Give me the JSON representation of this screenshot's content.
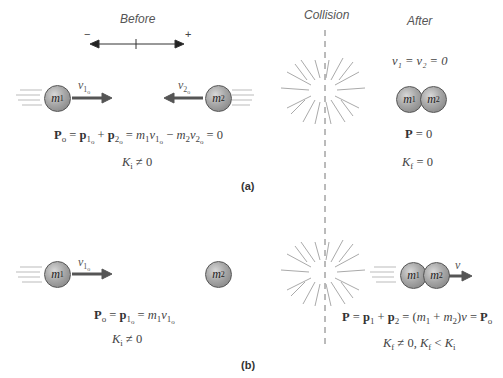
{
  "panel_a": {
    "label": "(a)",
    "before_label": "Before",
    "collision_label": "Collision",
    "after_label": "After",
    "axis": {
      "minus": "−",
      "plus": "+"
    },
    "ball1": {
      "mass": "m",
      "sub": "1"
    },
    "ball2": {
      "mass": "m",
      "sub": "2"
    },
    "v1o": {
      "v": "v",
      "sub": "1",
      "subsub": "o"
    },
    "v2o": {
      "v": "v",
      "sub": "2",
      "subsub": "o"
    },
    "momentum_eq": {
      "P": "P",
      "o": "o",
      "eq1": " = ",
      "p1": "p",
      "p1sub": "1",
      "p1subsub": "o",
      "plus": " + ",
      "p2": "p",
      "p2sub": "2",
      "p2subsub": "o",
      "eq2": " = ",
      "m1": "m",
      "m1sub": "1",
      "v1": "v",
      "v1sub": "1",
      "v1subsub": "o",
      "minus": " − ",
      "m2": "m",
      "m2sub": "2",
      "v2": "v",
      "v2sub": "2",
      "v2subsub": "o",
      "tail": " = 0"
    },
    "ki": {
      "K": "K",
      "sub": "i",
      "rest": " ≠ 0"
    },
    "after_velocity": "v₁ = v₂ = 0",
    "after_ball1": {
      "mass": "m",
      "sub": "1"
    },
    "after_ball2": {
      "mass": "m",
      "sub": "2"
    },
    "after_P": {
      "P": "P",
      "rest": " = 0"
    },
    "kf": {
      "K": "K",
      "sub": "f",
      "rest": " = 0"
    }
  },
  "panel_b": {
    "label": "(b)",
    "ball1": {
      "mass": "m",
      "sub": "1"
    },
    "ball2": {
      "mass": "m",
      "sub": "2"
    },
    "v1o": {
      "v": "v",
      "sub": "1",
      "subsub": "o"
    },
    "momentum_eq": {
      "P": "P",
      "o": "o",
      "eq1": " = ",
      "p1": "p",
      "p1sub": "1",
      "p1subsub": "o",
      "eq2": " = ",
      "m1": "m",
      "m1sub": "1",
      "v1": "v",
      "v1sub": "1",
      "v1subsub": "o"
    },
    "ki": {
      "K": "K",
      "sub": "i",
      "rest": " ≠ 0"
    },
    "after_ball1": {
      "mass": "m",
      "sub": "1"
    },
    "after_ball2": {
      "mass": "m",
      "sub": "2"
    },
    "after_v": "v",
    "after_eq": {
      "P": "P",
      "eq1": " = ",
      "p1": "p",
      "p1sub": "1",
      "plus": " + ",
      "p2": "p",
      "p2sub": "2",
      "eq2": " = (",
      "m1": "m",
      "m1sub": "1",
      "plus2": " + ",
      "m2": "m",
      "m2sub": "2",
      "close": ")",
      "v": "v",
      "eq3": " = ",
      "Po": "P",
      "Posub": "o"
    },
    "kf": {
      "K": "K",
      "sub": "f",
      "rest1": " ≠ 0, ",
      "K2": "K",
      "sub2": "f",
      "lt": " < ",
      "K3": "K",
      "sub3": "i"
    }
  }
}
